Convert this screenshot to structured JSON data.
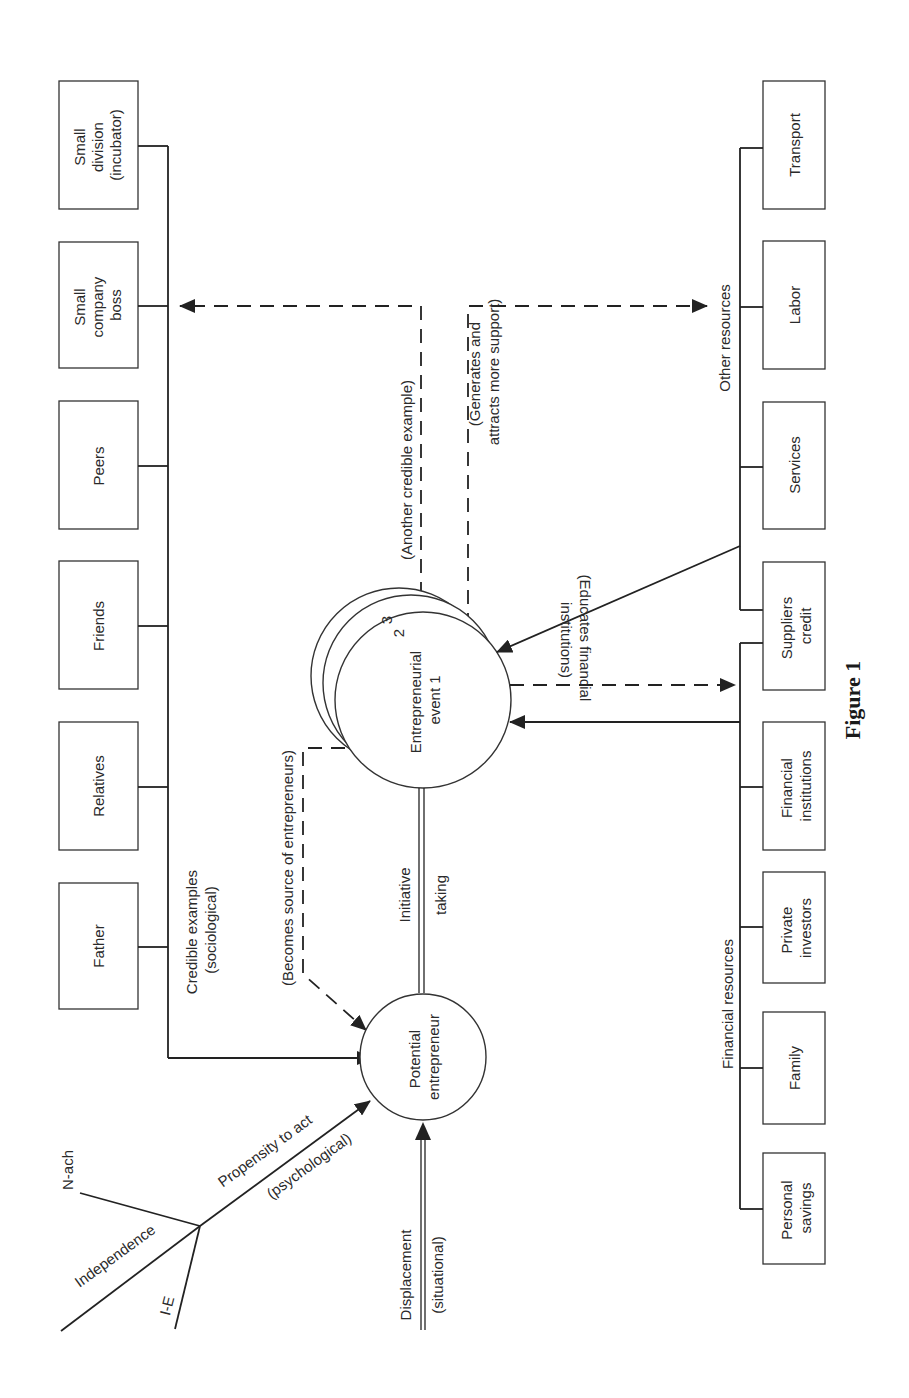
{
  "figure": {
    "caption": "Figure 1",
    "orientation": "rotated 90 degrees counter-clockwise"
  },
  "psychological": {
    "inputs": [
      "N-ach",
      "Independence",
      "I-E"
    ],
    "label_line1": "Propensity to act",
    "label_line2": "(psychological)"
  },
  "situational": {
    "label_line1": "Displacement",
    "label_line2": "(situational)"
  },
  "potential_entrepreneur": {
    "line1": "Potential",
    "line2": "entrepreneur"
  },
  "initiative": {
    "line1": "Initiative",
    "line2": "taking"
  },
  "entrepreneurial_event": {
    "line1": "Entrepreneurial",
    "line2": "event 1",
    "stack_numbers": [
      "2",
      "3"
    ]
  },
  "sociological": {
    "label_line1": "Credible examples",
    "label_line2": "(sociological)",
    "boxes": [
      {
        "line1": "Father",
        "line2": "",
        "line3": ""
      },
      {
        "line1": "Relatives",
        "line2": "",
        "line3": ""
      },
      {
        "line1": "Friends",
        "line2": "",
        "line3": ""
      },
      {
        "line1": "Peers",
        "line2": "",
        "line3": ""
      },
      {
        "line1": "Small",
        "line2": "company",
        "line3": "boss"
      },
      {
        "line1": "Small",
        "line2": "division",
        "line3": "(incubator)"
      }
    ]
  },
  "feedback": {
    "becomes_source": "(Becomes source of entrepreneurs)",
    "another_example": "(Another credible example)",
    "generates_line1": "(Generates and",
    "generates_line2": "attracts more support)",
    "educates_line1": "(Educates financial",
    "educates_line2": "institutions)"
  },
  "financial_resources": {
    "label": "Financial resources",
    "boxes": [
      {
        "line1": "Personal",
        "line2": "savings"
      },
      {
        "line1": "Family",
        "line2": ""
      },
      {
        "line1": "Private",
        "line2": "investors"
      },
      {
        "line1": "Financial",
        "line2": "institutions"
      },
      {
        "line1": "Suppliers",
        "line2": "credit"
      }
    ]
  },
  "other_resources": {
    "label": "Other resources",
    "boxes": [
      {
        "line1": "Services"
      },
      {
        "line1": "Labor"
      },
      {
        "line1": "Transport"
      }
    ]
  }
}
